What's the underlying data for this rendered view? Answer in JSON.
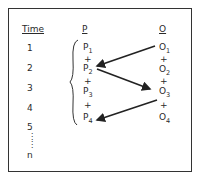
{
  "headers": {
    "time": "Time",
    "p": "P",
    "o": "O"
  },
  "time_labels": [
    "1",
    "2",
    "3",
    "4",
    "5",
    "n"
  ],
  "time_ellipsis": "⋮",
  "p_column": [
    {
      "base": "P",
      "sub": "1"
    },
    {
      "base": "P",
      "sub": "2"
    },
    {
      "base": "P",
      "sub": "3"
    },
    {
      "base": "P",
      "sub": "4"
    }
  ],
  "o_column": [
    {
      "base": "O",
      "sub": "1"
    },
    {
      "base": "O",
      "sub": "2"
    },
    {
      "base": "O",
      "sub": "3"
    },
    {
      "base": "O",
      "sub": "4"
    }
  ],
  "plus": "+",
  "arrows": [
    {
      "from": "O1",
      "to": "P2"
    },
    {
      "from": "P2",
      "to": "O3"
    },
    {
      "from": "O3",
      "to": "P4"
    }
  ]
}
